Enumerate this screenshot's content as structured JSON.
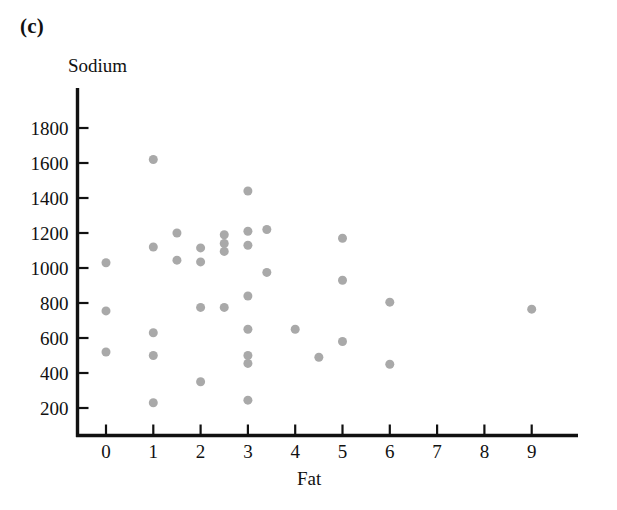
{
  "figure": {
    "panel_label": "(c)",
    "accent_point_color": "#a9a9a9",
    "axis_color": "#111111"
  },
  "chart_data": {
    "type": "scatter",
    "title": "",
    "subtitle": "",
    "xlabel": "Fat",
    "ylabel": "Sodium",
    "xlim": [
      -0.45,
      10.1
    ],
    "ylim": [
      80,
      1920
    ],
    "grid": false,
    "legend": null,
    "xticks": [
      0,
      1,
      2,
      3,
      4,
      5,
      6,
      7,
      8,
      9
    ],
    "xtick_labels": [
      "0",
      "1",
      "2",
      "3",
      "4",
      "5",
      "6",
      "7",
      "8",
      "9"
    ],
    "yticks": [
      200,
      400,
      600,
      800,
      1000,
      1200,
      1400,
      1600,
      1800
    ],
    "ytick_labels": [
      "200",
      "400",
      "600",
      "800",
      "1000",
      "1200",
      "1400",
      "1600",
      "1800"
    ],
    "marker": "filled-circle",
    "marker_color": "#a9a9a9",
    "marker_size": 9,
    "points": [
      {
        "x": 0,
        "y": 1030
      },
      {
        "x": 0,
        "y": 755
      },
      {
        "x": 0,
        "y": 520
      },
      {
        "x": 1,
        "y": 1620
      },
      {
        "x": 1,
        "y": 1120
      },
      {
        "x": 1,
        "y": 630
      },
      {
        "x": 1,
        "y": 500
      },
      {
        "x": 1,
        "y": 230
      },
      {
        "x": 1.5,
        "y": 1200
      },
      {
        "x": 1.5,
        "y": 1045
      },
      {
        "x": 2,
        "y": 1115
      },
      {
        "x": 2,
        "y": 1035
      },
      {
        "x": 2,
        "y": 775
      },
      {
        "x": 2,
        "y": 350
      },
      {
        "x": 2.5,
        "y": 1190
      },
      {
        "x": 2.5,
        "y": 1140
      },
      {
        "x": 2.5,
        "y": 1095
      },
      {
        "x": 2.5,
        "y": 775
      },
      {
        "x": 3,
        "y": 1440
      },
      {
        "x": 3,
        "y": 1210
      },
      {
        "x": 3,
        "y": 1130
      },
      {
        "x": 3,
        "y": 840
      },
      {
        "x": 3,
        "y": 650
      },
      {
        "x": 3,
        "y": 500
      },
      {
        "x": 3,
        "y": 455
      },
      {
        "x": 3,
        "y": 245
      },
      {
        "x": 3.4,
        "y": 1220
      },
      {
        "x": 3.4,
        "y": 975
      },
      {
        "x": 4,
        "y": 650
      },
      {
        "x": 4.5,
        "y": 490
      },
      {
        "x": 5,
        "y": 1170
      },
      {
        "x": 5,
        "y": 930
      },
      {
        "x": 5,
        "y": 580
      },
      {
        "x": 6,
        "y": 805
      },
      {
        "x": 6,
        "y": 450
      },
      {
        "x": 9,
        "y": 765
      }
    ]
  }
}
